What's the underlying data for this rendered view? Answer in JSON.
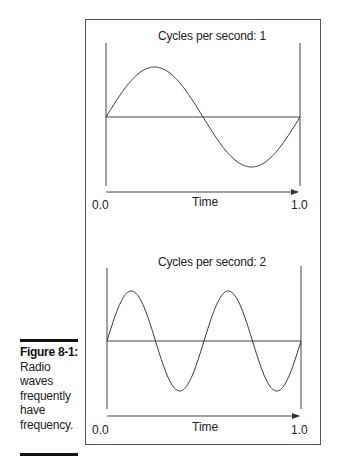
{
  "figure": {
    "label": "Figure 8-1:",
    "caption_lines": [
      "Radio",
      "waves",
      "frequently",
      "have",
      "frequency."
    ]
  },
  "panels": [
    {
      "title": "Cycles per second: 1",
      "x_label": "Time",
      "x_start": "0.0",
      "x_end": "1.0"
    },
    {
      "title": "Cycles per second: 2",
      "x_label": "Time",
      "x_start": "0.0",
      "x_end": "1.0"
    }
  ],
  "chart_data": [
    {
      "type": "line",
      "title": "Cycles per second: 1",
      "xlabel": "Time",
      "ylabel": "",
      "xlim": [
        0.0,
        1.0
      ],
      "tick_labels": [
        "0.0",
        "1.0"
      ],
      "series": [
        {
          "name": "sine wave",
          "frequency": 1,
          "function": "sin(2*pi*1*t)"
        }
      ],
      "grid": false
    },
    {
      "type": "line",
      "title": "Cycles per second: 2",
      "xlabel": "Time",
      "ylabel": "",
      "xlim": [
        0.0,
        1.0
      ],
      "tick_labels": [
        "0.0",
        "1.0"
      ],
      "series": [
        {
          "name": "sine wave",
          "frequency": 2,
          "function": "sin(2*pi*2*t)"
        }
      ],
      "grid": false
    }
  ],
  "colors": {
    "line": "#333333",
    "frame": "#555555",
    "rule": "#111111"
  }
}
